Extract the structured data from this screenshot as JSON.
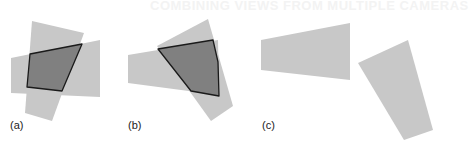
{
  "figure": {
    "background_text": "COMBINING VIEWS FROM MULTIPLE CAMERAS",
    "colors": {
      "light_fill": "#c8c8c8",
      "dark_fill": "#808080",
      "outline": "#1a1a1a",
      "background": "#ffffff"
    },
    "panels": [
      {
        "label": "(a)",
        "description": "Two overlapping camera view trapezoids; intersection region outlined and shaded dark",
        "horizontal_view": [
          [
            11,
            58
          ],
          [
            100,
            40
          ],
          [
            100,
            97
          ],
          [
            11,
            93
          ]
        ],
        "vertical_view": [
          [
            32,
            21
          ],
          [
            84,
            33
          ],
          [
            52,
            121
          ],
          [
            25,
            113
          ]
        ],
        "intersection": [
          [
            30,
            54
          ],
          [
            82,
            44
          ],
          [
            62,
            91
          ],
          [
            27,
            87
          ]
        ]
      },
      {
        "label": "(b)",
        "description": "Two overlapping camera view trapezoids at different orientation; intersection outlined and shaded dark",
        "horizontal_view": [
          [
            128,
            55
          ],
          [
            218,
            40
          ],
          [
            219,
            95
          ],
          [
            128,
            83
          ]
        ],
        "vertical_view": [
          [
            157,
            46
          ],
          [
            208,
            19
          ],
          [
            233,
            106
          ],
          [
            211,
            121
          ]
        ],
        "intersection": [
          [
            158,
            49
          ],
          [
            213,
            40
          ],
          [
            218,
            62
          ],
          [
            219,
            96
          ],
          [
            191,
            91
          ]
        ]
      },
      {
        "label": "(c)",
        "description": "Two non-overlapping camera view trapezoids; no intersection",
        "horizontal_view": [
          [
            261,
            40
          ],
          [
            350,
            23
          ],
          [
            350,
            80
          ],
          [
            261,
            70
          ]
        ],
        "vertical_view": [
          [
            358,
            63
          ],
          [
            408,
            40
          ],
          [
            433,
            130
          ],
          [
            404,
            140
          ]
        ],
        "intersection": null
      }
    ]
  }
}
